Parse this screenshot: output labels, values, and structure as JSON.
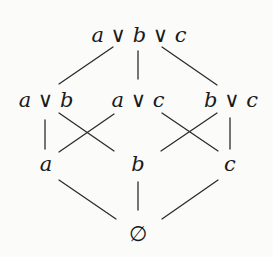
{
  "diagram": {
    "type": "hasse-lattice",
    "nodes": [
      {
        "id": "abc",
        "label": "a ∨ b ∨ c",
        "parts": [
          "a",
          "∨",
          "b",
          "∨",
          "c"
        ],
        "x": 139,
        "y": 42,
        "level": 3
      },
      {
        "id": "ab",
        "label": "a ∨ b",
        "parts": [
          "a",
          "∨",
          "b"
        ],
        "x": 46,
        "y": 107,
        "level": 2
      },
      {
        "id": "ac",
        "label": "a ∨ c",
        "parts": [
          "a",
          "∨",
          "c"
        ],
        "x": 138,
        "y": 107,
        "level": 2
      },
      {
        "id": "bc",
        "label": "b ∨ c",
        "parts": [
          "b",
          "∨",
          "c"
        ],
        "x": 231,
        "y": 107,
        "level": 2
      },
      {
        "id": "a",
        "label": "a",
        "x": 46,
        "y": 171,
        "level": 1
      },
      {
        "id": "b",
        "label": "b",
        "x": 138,
        "y": 171,
        "level": 1
      },
      {
        "id": "c",
        "label": "c",
        "x": 230,
        "y": 171,
        "level": 1
      },
      {
        "id": "empty",
        "label": "∅",
        "x": 138,
        "y": 241,
        "level": 0
      }
    ],
    "edges": [
      {
        "from": "abc",
        "to": "ab"
      },
      {
        "from": "abc",
        "to": "ac"
      },
      {
        "from": "abc",
        "to": "bc"
      },
      {
        "from": "ab",
        "to": "a"
      },
      {
        "from": "ab",
        "to": "b"
      },
      {
        "from": "ac",
        "to": "a"
      },
      {
        "from": "ac",
        "to": "c"
      },
      {
        "from": "bc",
        "to": "b"
      },
      {
        "from": "bc",
        "to": "c"
      },
      {
        "from": "a",
        "to": "empty"
      },
      {
        "from": "b",
        "to": "empty"
      },
      {
        "from": "c",
        "to": "empty"
      }
    ],
    "labels": {
      "top": {
        "v1": "a",
        "op1": "∨",
        "v2": "b",
        "op2": "∨",
        "v3": "c"
      },
      "ab": {
        "v1": "a",
        "op": "∨",
        "v2": "b"
      },
      "ac": {
        "v1": "a",
        "op": "∨",
        "v2": "c"
      },
      "bc": {
        "v1": "b",
        "op": "∨",
        "v2": "c"
      },
      "a": "a",
      "b": "b",
      "c": "c",
      "bottom": "∅"
    }
  }
}
